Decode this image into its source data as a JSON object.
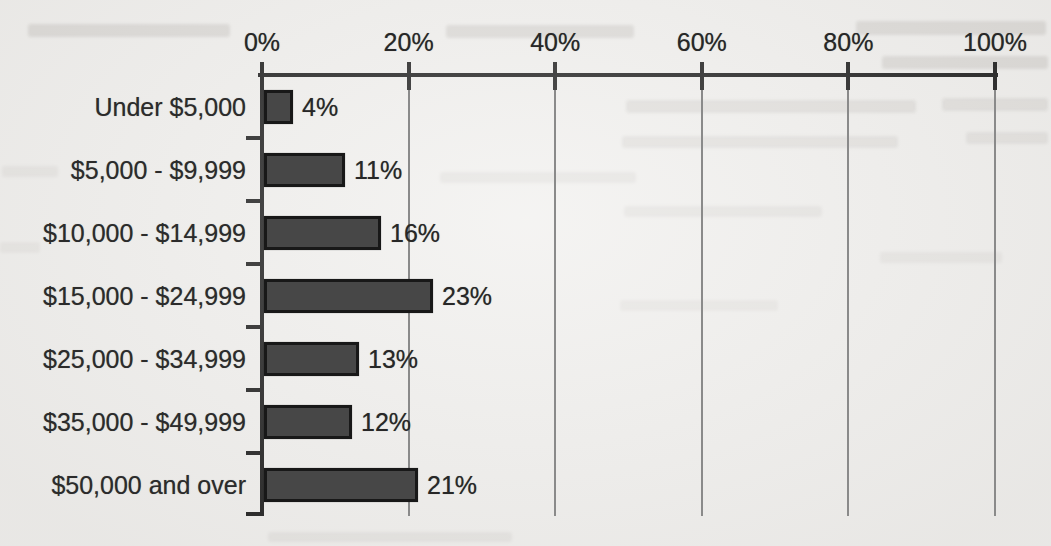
{
  "chart_data": {
    "type": "bar",
    "orientation": "horizontal",
    "title": "",
    "categories": [
      "Under $5,000",
      "$5,000 - $9,999",
      "$10,000 - $14,999",
      "$15,000 - $24,999",
      "$25,000 - $34,999",
      "$35,000 - $49,999",
      "$50,000 and over"
    ],
    "values": [
      4,
      11,
      16,
      23,
      13,
      12,
      21
    ],
    "value_labels": [
      "4%",
      "11%",
      "16%",
      "23%",
      "13%",
      "12%",
      "21%"
    ],
    "x_axis": {
      "position": "top",
      "min": 0,
      "max": 100,
      "tick_values": [
        0,
        20,
        40,
        60,
        80,
        100
      ],
      "tick_labels": [
        "0%",
        "20%",
        "40%",
        "60%",
        "80%",
        "100%"
      ]
    },
    "grid": true,
    "legend": false,
    "colors": {
      "bar_fill": "#474747",
      "bar_border": "#181818",
      "gridline": "#8a8a8a",
      "axis": "#1f1f1f",
      "text": "#2b2b2b",
      "background": "#f1f0ee"
    }
  }
}
